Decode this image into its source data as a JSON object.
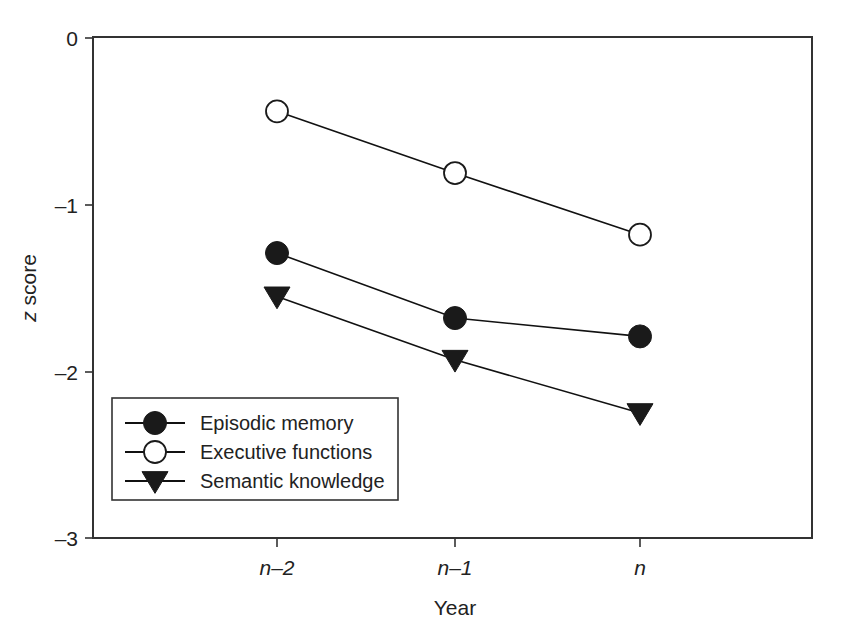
{
  "chart_data": {
    "type": "line",
    "title": "",
    "subtitle": "",
    "xlabel": "Year",
    "ylabel": "z score",
    "categories": [
      "n–2",
      "n–1",
      "n"
    ],
    "xtick_labels": [
      "n–2",
      "n–1",
      "n"
    ],
    "ytick_labels": [
      "0",
      "–1",
      "–2",
      "–3"
    ],
    "ytick_values": [
      0,
      -1,
      -2,
      -3
    ],
    "ylim": [
      -3,
      0
    ],
    "grid": false,
    "legend_position": "inside-lower-left",
    "series": [
      {
        "name": "Episodic memory",
        "marker": "filled-circle",
        "values": [
          -1.29,
          -1.68,
          -1.79
        ]
      },
      {
        "name": "Executive functions",
        "marker": "open-circle",
        "values": [
          -0.44,
          -0.81,
          -1.18
        ]
      },
      {
        "name": "Semantic knowledge",
        "marker": "filled-triangle",
        "values": [
          -1.55,
          -1.93,
          -2.25
        ]
      }
    ]
  },
  "axes": {
    "y_axis_title": "z score",
    "y_axis_title_italic_part": "z",
    "y_axis_title_rest": " score",
    "x_axis_title": "Year"
  },
  "legend": {
    "entries": [
      {
        "label": "Episodic memory",
        "marker": "filled-circle"
      },
      {
        "label": "Executive functions",
        "marker": "open-circle"
      },
      {
        "label": "Semantic knowledge",
        "marker": "filled-triangle"
      }
    ]
  },
  "colors": {
    "ink": "#1a1a1a",
    "axis": "#333333",
    "background": "#ffffff"
  }
}
